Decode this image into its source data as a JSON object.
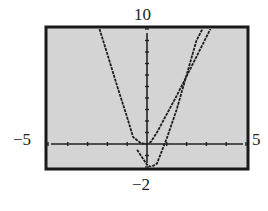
{
  "chart_data": {
    "type": "line",
    "title": "",
    "xlabel": "",
    "ylabel": "",
    "xlim": [
      -5,
      5
    ],
    "ylim": [
      -2,
      10
    ],
    "xscale": 1,
    "yscale": 1,
    "tick_labels": {
      "xmin": "−5",
      "xmax": "5",
      "ymin": "−2",
      "ymax": "10"
    },
    "grid": false,
    "background_color": "#d4d4d4",
    "series": [
      {
        "name": "parabola",
        "description": "narrow upward parabola with vertex near (0.2, -2)",
        "x": [
          -0.5,
          0,
          0.2,
          0.5,
          1,
          1.5,
          2,
          2.5,
          2.8
        ],
        "y": [
          -0.5,
          -1.8,
          -2,
          -1.7,
          0.5,
          3,
          6,
          9,
          10
        ]
      },
      {
        "name": "v-shaped parabola",
        "description": "wider upward curve; left branch from (-2.4,10) to (-0.7,0), right branch from (0.2,0) to (3.2,10)",
        "x": [
          -2.4,
          -2,
          -1.5,
          -1,
          -0.7,
          -0.3,
          0,
          0.2,
          0.5,
          1,
          1.5,
          2,
          2.5,
          3,
          3.2
        ],
        "y": [
          10,
          7.8,
          5,
          2.3,
          0.6,
          0.05,
          0,
          0.2,
          1,
          2.6,
          4.2,
          5.9,
          7.6,
          9.3,
          10
        ]
      }
    ]
  }
}
